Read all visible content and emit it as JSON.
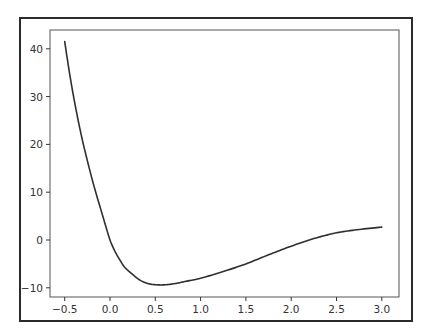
{
  "chart_data": {
    "type": "line",
    "title": "",
    "xlabel": "",
    "ylabel": "",
    "xlim": [
      -0.68,
      3.18
    ],
    "ylim": [
      -11.8,
      43.7
    ],
    "grid": false,
    "legend": null,
    "xticks": [
      -0.5,
      0.0,
      0.5,
      1.0,
      1.5,
      2.0,
      2.5,
      3.0
    ],
    "xtick_labels": [
      "−0.5",
      "0.0",
      "0.5",
      "1.0",
      "1.5",
      "2.0",
      "2.5",
      "3.0"
    ],
    "yticks": [
      -10,
      0,
      10,
      20,
      30,
      40
    ],
    "ytick_labels": [
      "−10",
      "0",
      "10",
      "20",
      "30",
      "40"
    ],
    "series": [
      {
        "name": "f(x)",
        "color": "#2f2f2f",
        "x": [
          -0.5,
          -0.45,
          -0.4,
          -0.35,
          -0.3,
          -0.25,
          -0.2,
          -0.15,
          -0.1,
          -0.05,
          0.0,
          0.05,
          0.1,
          0.15,
          0.2,
          0.25,
          0.3,
          0.35,
          0.4,
          0.45,
          0.5,
          0.57,
          0.65,
          0.75,
          0.85,
          1.0,
          1.25,
          1.5,
          1.75,
          2.0,
          2.25,
          2.5,
          2.75,
          3.0
        ],
        "y": [
          41.5,
          35.3,
          29.8,
          24.9,
          20.5,
          16.6,
          12.9,
          9.5,
          6.3,
          3.1,
          0.0,
          -2.2,
          -3.9,
          -5.4,
          -6.4,
          -7.2,
          -8.0,
          -8.6,
          -9.0,
          -9.25,
          -9.35,
          -9.4,
          -9.3,
          -9.0,
          -8.6,
          -8.0,
          -6.6,
          -5.0,
          -3.1,
          -1.3,
          0.3,
          1.5,
          2.2,
          2.7
        ]
      }
    ]
  },
  "axes": {
    "frame_color": "#2b2b2b",
    "spine_color": "#555555",
    "tick_color": "#333333"
  }
}
